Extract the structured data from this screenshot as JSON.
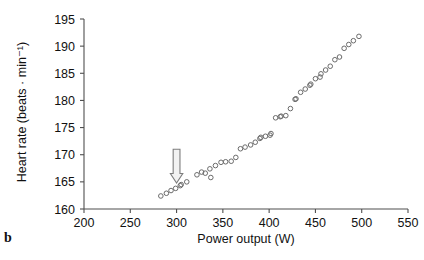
{
  "panel": {
    "label": "b"
  },
  "chart_data": {
    "type": "scatter",
    "title": "",
    "xlabel": "Power output (W)",
    "ylabel": "Heart rate (beats · min⁻¹)",
    "xlim": [
      200,
      550
    ],
    "ylim": [
      160,
      195
    ],
    "xticks": [
      200,
      250,
      300,
      350,
      400,
      450,
      500,
      550
    ],
    "yticks": [
      160,
      165,
      170,
      175,
      180,
      185,
      190,
      195
    ],
    "grid": false,
    "legend": null,
    "marker_style": "open-circle",
    "marker_color": "#6b6b6b",
    "series": [
      {
        "name": "Heart rate vs power output",
        "x": [
          283,
          289,
          294,
          299,
          304,
          305,
          311,
          322,
          327,
          331,
          336,
          337,
          342,
          348,
          353,
          359,
          364,
          369,
          374,
          380,
          385,
          390,
          391,
          396,
          401,
          402,
          407,
          412,
          413,
          418,
          423,
          428,
          429,
          434,
          439,
          444,
          445,
          450,
          455,
          456,
          461,
          466,
          471,
          476,
          481,
          486,
          491,
          497
        ],
        "y": [
          162.4,
          162.9,
          163.4,
          163.8,
          164.3,
          164.5,
          165.0,
          166.3,
          166.8,
          166.6,
          167.4,
          165.8,
          168.0,
          168.6,
          168.7,
          168.8,
          169.5,
          171.1,
          171.4,
          171.8,
          172.3,
          173.0,
          173.2,
          173.4,
          173.6,
          173.9,
          176.8,
          177.0,
          177.1,
          177.2,
          178.5,
          180.2,
          180.3,
          181.5,
          182.1,
          182.8,
          183.0,
          184.0,
          184.3,
          184.9,
          185.6,
          186.3,
          187.5,
          188.0,
          189.6,
          190.3,
          191.0,
          191.8
        ]
      }
    ],
    "annotations": [
      {
        "type": "arrow",
        "direction": "down",
        "x": 300,
        "y_from": 171.0,
        "y_to": 164.8,
        "label": ""
      }
    ]
  }
}
